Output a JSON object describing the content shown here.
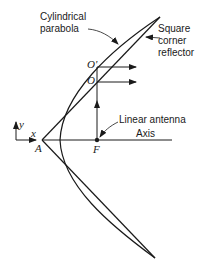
{
  "diagram": {
    "labels": {
      "cylindrical_parabola_line1": "Cylindrical",
      "cylindrical_parabola_line2": "parabola",
      "square_corner_line1": "Square",
      "square_corner_line2": "corner",
      "square_corner_line3": "reflector",
      "linear_antenna": "Linear antenna",
      "axis": "Axis",
      "point_O_prime": "O'",
      "point_O": "O",
      "point_A": "A",
      "point_F": "F",
      "coord_x": "x",
      "coord_y": "y"
    },
    "colors": {
      "stroke": "#1a1a1a",
      "background": "#ffffff"
    }
  }
}
